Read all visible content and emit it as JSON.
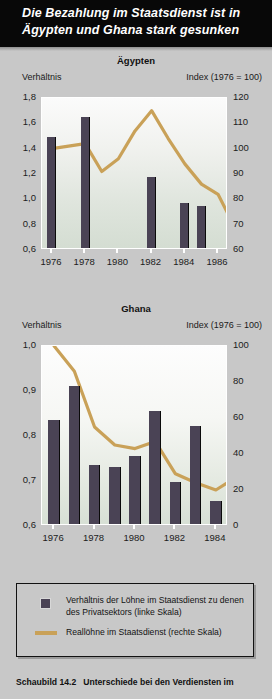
{
  "header": {
    "title": "Die Bezahlung im Staatsdienst ist in Ägypten und Ghana stark gesunken"
  },
  "legend": {
    "bar_label": "Verhältnis der Löhne im Staatsdienst zu denen des Privatsektors (linke Skala)",
    "line_label": "Reallöhne im Staatsdienst (rechte Skala)",
    "bar_color": "#4a4355",
    "line_color": "#c9a158"
  },
  "caption": {
    "number": "Schaubild 14.2",
    "text": "Unterschiede bei den Verdiensten im"
  },
  "chart_data": [
    {
      "type": "bar",
      "title": "Ägypten",
      "ylabel": "Verhältnis",
      "y2label": "Index (1976 = 100)",
      "xlabel": "",
      "ylim": [
        0.6,
        1.8
      ],
      "y2lim": [
        60,
        120
      ],
      "grid": false,
      "legend_position": "below",
      "yticks": [
        "1,8",
        "1,6",
        "1,4",
        "1,2",
        "1,0",
        "0,8",
        "0,6"
      ],
      "ytick_values": [
        1.8,
        1.6,
        1.4,
        1.2,
        1.0,
        0.8,
        0.6
      ],
      "y2ticks": [
        "120",
        "110",
        "100",
        "90",
        "80",
        "70",
        "60"
      ],
      "y2tick_values": [
        120,
        110,
        100,
        90,
        80,
        70,
        60
      ],
      "xticks": [
        "1976",
        "1978",
        "1980",
        "1982",
        "1984",
        "1986"
      ],
      "xtick_values": [
        1976,
        1978,
        1980,
        1982,
        1984,
        1986
      ],
      "xlim": [
        1975.4,
        1986.6
      ],
      "series": [
        {
          "name": "Verhältnis der Löhne im Staatsdienst zu denen des Privatsektors",
          "kind": "bar",
          "axis": "left",
          "x": [
            1976,
            1978,
            1982,
            1984,
            1985
          ],
          "values": [
            1.49,
            1.65,
            1.18,
            0.97,
            0.95
          ]
        },
        {
          "name": "Reallöhne im Staatsdienst",
          "kind": "line",
          "axis": "right",
          "x": [
            1976,
            1977,
            1978,
            1979,
            1980,
            1981,
            1982,
            1983,
            1984,
            1985,
            1986
          ],
          "values": [
            100,
            101,
            102,
            91,
            96,
            107,
            115,
            104,
            94,
            86,
            82,
            69
          ]
        }
      ]
    },
    {
      "type": "bar",
      "title": "Ghana",
      "ylabel": "Verhältnis",
      "y2label": "Index (1976 = 100)",
      "xlabel": "",
      "ylim": [
        0.6,
        1.0
      ],
      "y2lim": [
        0,
        100
      ],
      "grid": false,
      "legend_position": "below",
      "yticks": [
        "1,0",
        "0,9",
        "0,8",
        "0,7",
        "0,6"
      ],
      "ytick_values": [
        1.0,
        0.9,
        0.8,
        0.7,
        0.6
      ],
      "y2ticks": [
        "100",
        "80",
        "60",
        "40",
        "20",
        "0"
      ],
      "y2tick_values": [
        100,
        80,
        60,
        40,
        20,
        0
      ],
      "xticks": [
        "1976",
        "1978",
        "1980",
        "1982",
        "1984"
      ],
      "xtick_values": [
        1976,
        1978,
        1980,
        1982,
        1984
      ],
      "xlim": [
        1975.4,
        1984.6
      ],
      "series": [
        {
          "name": "Verhältnis der Löhne im Staatsdienst zu denen des Privatsektors",
          "kind": "bar",
          "axis": "left",
          "x": [
            1976,
            1977,
            1978,
            1979,
            1980,
            1981,
            1982,
            1983,
            1984
          ],
          "values": [
            0.835,
            0.912,
            0.735,
            0.732,
            0.755,
            0.855,
            0.697,
            0.822,
            0.655
          ]
        },
        {
          "name": "Reallöhne im Staatsdienst",
          "kind": "line",
          "axis": "right",
          "x": [
            1976,
            1977,
            1978,
            1979,
            1980,
            1981,
            1982,
            1983,
            1984
          ],
          "values": [
            100,
            86,
            55,
            45,
            43,
            47,
            29,
            24,
            20,
            27
          ]
        }
      ]
    }
  ]
}
